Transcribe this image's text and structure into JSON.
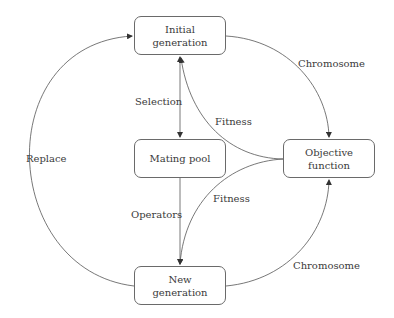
{
  "nodes": {
    "initial": {
      "line1": "Initial",
      "line2": "generation"
    },
    "mating": {
      "label": "Mating pool"
    },
    "objective": {
      "line1": "Objective",
      "line2": "function"
    },
    "newgen": {
      "line1": "New",
      "line2": "generation"
    }
  },
  "edges": {
    "selection": "Selection",
    "operators": "Operators",
    "replace": "Replace",
    "chromosome_top": "Chromosome",
    "chromosome_bottom": "Chromosome",
    "fitness_top": "Fitness",
    "fitness_bottom": "Fitness"
  },
  "colors": {
    "line": "#555555",
    "text": "#3a3a3a"
  }
}
